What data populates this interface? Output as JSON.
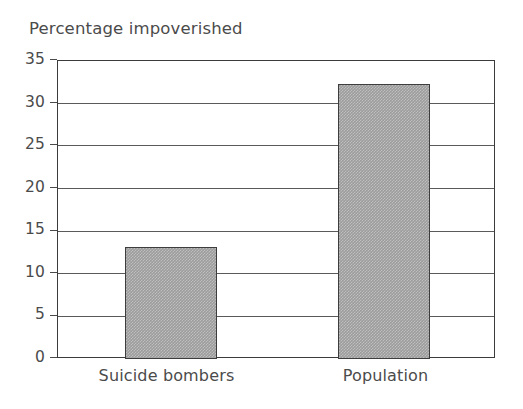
{
  "chart_data": {
    "type": "bar",
    "title": "Percentage impoverished",
    "xlabel": "",
    "ylabel": "",
    "categories": [
      "Suicide bombers",
      "Population"
    ],
    "values": [
      13.2,
      32.3
    ],
    "ylim": [
      0,
      35
    ],
    "yticks": [
      "0",
      "5",
      "10",
      "15",
      "20",
      "25",
      "30",
      "35"
    ],
    "ytick_values": [
      0,
      5,
      10,
      15,
      20,
      25,
      30,
      35
    ],
    "grid": true,
    "legend": null,
    "legend_position": "none",
    "series": [
      {
        "name": "Percentage impoverished",
        "values": [
          13.2,
          32.3
        ]
      }
    ],
    "colors": {
      "bar_fill": "#9c9c9c",
      "bar_edge": "#3d3d3d",
      "frame": "#3b3b3b",
      "gridline": "#5a5a5a",
      "text": "#4b4b4b",
      "background": "#ffffff"
    }
  }
}
